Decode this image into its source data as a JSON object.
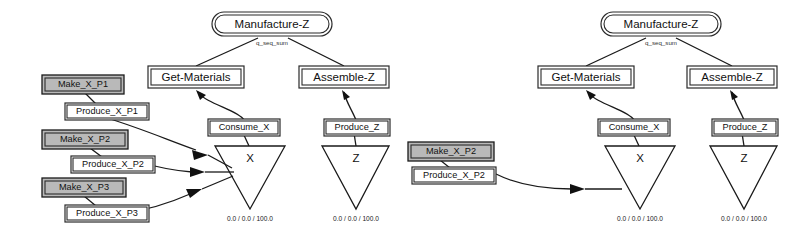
{
  "diagram": {
    "title_visible": false,
    "colors": {
      "shaded_fill": "#b9b9b9",
      "node_fill": "#ffffff",
      "stroke": "#1a1a1a"
    },
    "panels": [
      {
        "id": "left-panel",
        "root": {
          "label": "Manufacture-Z",
          "shape": "stadium"
        },
        "root_edge_label": "q_seq_sum",
        "tasks": [
          {
            "label": "Get-Materials",
            "shape": "rect"
          },
          {
            "label": "Assemble-Z",
            "shape": "rect"
          }
        ],
        "operations": [
          {
            "label": "Consume_X",
            "shape": "rect"
          },
          {
            "label": "Produce_Z",
            "shape": "rect"
          }
        ],
        "resources": [
          {
            "label": "X",
            "shape": "triangle",
            "values": "0.0 / 0.0 / 100.0"
          },
          {
            "label": "Z",
            "shape": "triangle",
            "values": "0.0 / 0.0 / 100.0"
          }
        ],
        "providers": [
          {
            "make_label": "Make_X_P1",
            "produce_label": "Produce_X_P1",
            "shaded": true
          },
          {
            "make_label": "Make_X_P2",
            "produce_label": "Produce_X_P2",
            "shaded": true
          },
          {
            "make_label": "Make_X_P3",
            "produce_label": "Produce_X_P3",
            "shaded": true
          }
        ]
      },
      {
        "id": "right-panel",
        "root": {
          "label": "Manufacture-Z",
          "shape": "stadium"
        },
        "root_edge_label": "q_seq_sum",
        "tasks": [
          {
            "label": "Get-Materials",
            "shape": "rect"
          },
          {
            "label": "Assemble-Z",
            "shape": "rect"
          }
        ],
        "operations": [
          {
            "label": "Consume_X",
            "shape": "rect"
          },
          {
            "label": "Produce_Z",
            "shape": "rect"
          }
        ],
        "resources": [
          {
            "label": "X",
            "shape": "triangle",
            "values": "0.0 / 0.0 / 100.0"
          },
          {
            "label": "Z",
            "shape": "triangle",
            "values": "0.0 / 0.0 / 100.0"
          }
        ],
        "providers": [
          {
            "make_label": "Make_X_P2",
            "produce_label": "Produce_X_P2",
            "shaded": true
          }
        ]
      }
    ]
  }
}
